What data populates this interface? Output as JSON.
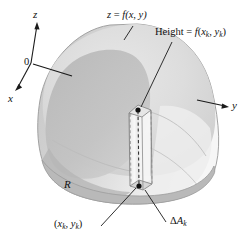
{
  "figure": {
    "type": "math-diagram-3d",
    "background_color": "#ffffff",
    "ink_color": "#111111"
  },
  "axes": {
    "z_label": "z",
    "x_label": "x",
    "y_label": "y",
    "origin_label": "0"
  },
  "labels": {
    "surface": {
      "lhs": "z",
      "equals": " = ",
      "fn": "f",
      "args": "(x, y)",
      "full": "z = f(x, y)"
    },
    "height": {
      "prefix": "Height = ",
      "fn": "f",
      "open": "(",
      "arg1_base": "x",
      "arg1_sub": "k",
      "comma": ", ",
      "arg2_base": "y",
      "arg2_sub": "k",
      "close": ")",
      "full": "Height = f(x_k, y_k)"
    },
    "sample_point": {
      "open": "(",
      "arg1_base": "x",
      "arg1_sub": "k",
      "comma": ", ",
      "arg2_base": "y",
      "arg2_sub": "k",
      "close": ")",
      "full": "(x_k, y_k)"
    },
    "area_element": {
      "delta": "Δ",
      "base": "A",
      "sub": "k",
      "full": "ΔA_k"
    },
    "region": {
      "full": "R"
    }
  },
  "colors": {
    "surface_light": "#e0e0e0",
    "surface_mid": "#cfcfcf",
    "surface_dark": "#b9b9b9",
    "surface_darker": "#aeaeae",
    "base_region": "#cccccc",
    "column_face": "#f2f2f2",
    "outline": "#8f8f8f",
    "ink": "#111111"
  },
  "geometry": {
    "origin": [
      31,
      63
    ],
    "z_axis_tip": [
      37,
      22
    ],
    "x_axis_tip": [
      15,
      90
    ],
    "y_axis_tip": [
      228,
      106
    ],
    "column_top_point": [
      138,
      110
    ],
    "column_bottom_point": [
      139,
      186
    ]
  }
}
